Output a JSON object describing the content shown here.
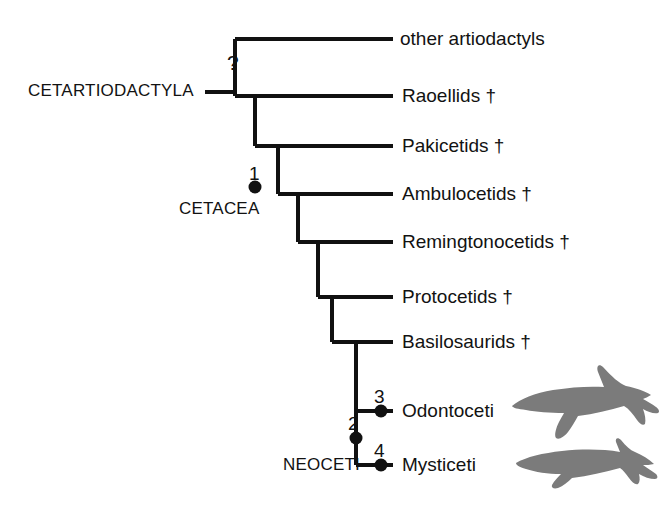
{
  "figure": {
    "type": "phylogenetic-cladogram"
  },
  "tips": [
    {
      "id": "other-artiodactyls",
      "label": "other artiodactyls",
      "y": 39,
      "branch_start_x": 235,
      "branch_end_x": 393,
      "label_x": 400
    },
    {
      "id": "raoellids",
      "label": "Raoellids †",
      "y": 96,
      "branch_start_x": 255,
      "branch_end_x": 393,
      "label_x": 402
    },
    {
      "id": "pakicetids",
      "label": "Pakicetids †",
      "y": 146,
      "branch_start_x": 278,
      "branch_end_x": 393,
      "label_x": 402
    },
    {
      "id": "ambulocetids",
      "label": "Ambulocetids †",
      "y": 194,
      "branch_start_x": 298,
      "branch_end_x": 393,
      "label_x": 402
    },
    {
      "id": "remingtonocetids",
      "label": "Remingtonocetids †",
      "y": 242,
      "branch_start_x": 318,
      "branch_end_x": 393,
      "label_x": 402
    },
    {
      "id": "protocetids",
      "label": "Protocetids †",
      "y": 297,
      "branch_start_x": 332,
      "branch_end_x": 393,
      "label_x": 402
    },
    {
      "id": "basilosaurids",
      "label": "Basilosaurids †",
      "y": 342,
      "branch_start_x": 356,
      "branch_end_x": 393,
      "label_x": 402
    },
    {
      "id": "odontoceti",
      "label": "Odontoceti",
      "y": 411,
      "branch_start_x": 381,
      "branch_end_x": 393,
      "label_x": 402
    },
    {
      "id": "mysticeti",
      "label": "Mysticeti",
      "y": 465,
      "branch_start_x": 381,
      "branch_end_x": 393,
      "label_x": 402
    }
  ],
  "clade_labels": [
    {
      "id": "cetartiodactyla",
      "text": "CETARTIODACTYLA",
      "x": 28,
      "y": 82,
      "pointer": {
        "x1": 205,
        "x2": 235,
        "y": 92
      }
    },
    {
      "id": "cetacea",
      "text": "CETACEA",
      "x": 179,
      "y": 200,
      "pointer": null
    },
    {
      "id": "neoceti",
      "text": "NEOCETI",
      "x": 283,
      "y": 456,
      "pointer": null
    }
  ],
  "nodes": [
    {
      "id": "node-1",
      "number": "1",
      "x": 255,
      "y": 187,
      "num_x": 249,
      "num_y": 164
    },
    {
      "id": "node-2",
      "number": "2",
      "x": 356,
      "y": 438,
      "num_x": 348,
      "num_y": 414
    },
    {
      "id": "node-3",
      "number": "3",
      "x": 381,
      "y": 411,
      "num_x": 374,
      "num_y": 387
    },
    {
      "id": "node-4",
      "number": "4",
      "x": 381,
      "y": 465,
      "num_x": 374,
      "num_y": 441
    }
  ],
  "uncertainty_marker": {
    "id": "root-question",
    "text": "?",
    "x": 227,
    "y": 52
  },
  "silhouettes": [
    {
      "id": "odontocete-silhouette",
      "name": "killer-whale-silhouette",
      "x": 512,
      "y": 376,
      "width": 148,
      "height": 62
    },
    {
      "id": "mysticete-silhouette",
      "name": "baleen-whale-silhouette",
      "x": 516,
      "y": 447,
      "width": 146,
      "height": 44
    }
  ],
  "style": {
    "line_color": "#111111",
    "line_width": 4,
    "node_color": "#111111",
    "node_radius": 6.5,
    "silhouette_color": "#7b7b7b",
    "background": "#ffffff",
    "text_color": "#121212"
  }
}
